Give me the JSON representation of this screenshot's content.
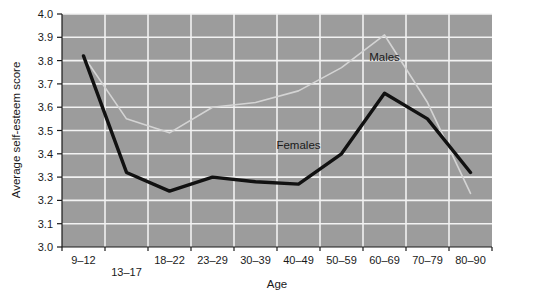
{
  "chart_data": {
    "type": "line",
    "title": "",
    "xlabel": "Age",
    "ylabel": "Average self-esteem score",
    "categories": [
      "9–12",
      "13–17",
      "18–22",
      "23–29",
      "30–39",
      "40–49",
      "50–59",
      "60–69",
      "70–79",
      "80–90"
    ],
    "ylim": [
      3.0,
      4.0
    ],
    "ytick_labels": [
      "3.0",
      "3.1",
      "3.2",
      "3.3",
      "3.4",
      "3.5",
      "3.6",
      "3.7",
      "3.8",
      "3.9",
      "4.0"
    ],
    "ytick_values": [
      3.0,
      3.1,
      3.2,
      3.3,
      3.4,
      3.5,
      3.6,
      3.7,
      3.8,
      3.9,
      4.0
    ],
    "grid": true,
    "legend_position": "inline-annotation",
    "series": [
      {
        "name": "Males",
        "color": "#d4d4d4",
        "values": [
          3.82,
          3.55,
          3.49,
          3.6,
          3.62,
          3.67,
          3.77,
          3.91,
          3.62,
          3.23
        ]
      },
      {
        "name": "Females",
        "color": "#111111",
        "values": [
          3.82,
          3.32,
          3.24,
          3.3,
          3.28,
          3.27,
          3.4,
          3.66,
          3.55,
          3.32
        ]
      }
    ],
    "annotations": [
      {
        "text": "Males",
        "x_category": "60–69",
        "y_value": 3.8
      },
      {
        "text": "Females",
        "x_category": "40–49",
        "y_value": 3.42
      }
    ],
    "plot_background": "#9c9c9c",
    "gridline_color": "#f2f2f2",
    "axis_color": "#1a1a1a"
  }
}
